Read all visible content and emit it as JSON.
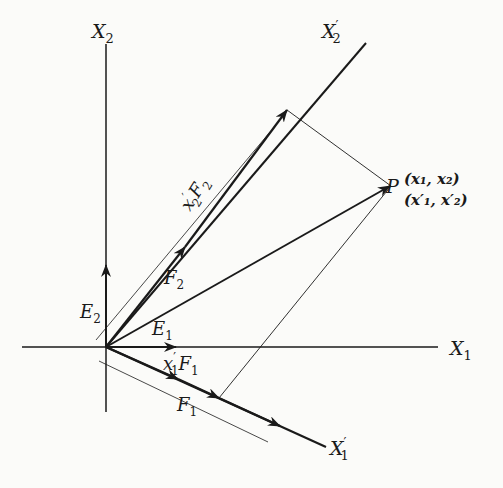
{
  "diagram": {
    "type": "oblique coordinate system vector decomposition",
    "axes": {
      "x1": {
        "label": "X",
        "sub": "1"
      },
      "x2": {
        "label": "X",
        "sub": "2"
      },
      "x1_prime": {
        "label": "X",
        "sub": "1",
        "prime": "′"
      },
      "x2_prime": {
        "label": "X",
        "sub": "2",
        "prime": "′"
      }
    },
    "vectors": {
      "e1": {
        "label": "E",
        "sub": "1"
      },
      "e2": {
        "label": "E",
        "sub": "2"
      },
      "f1": {
        "label": "F",
        "sub": "1"
      },
      "f2": {
        "label": "F",
        "sub": "2"
      },
      "x1f1": {
        "label": "x",
        "sub": "1",
        "prime": "′",
        "tail": "F",
        "tail_sub": "1"
      },
      "x2f2": {
        "label": "x",
        "sub": "2",
        "prime": "′",
        "tail": "F",
        "tail_sub": "2"
      }
    },
    "point": {
      "label": "P",
      "coords": "(x₁, x₂)",
      "coords_prime": "(x′₁, x′₂)"
    },
    "colors": {
      "ink": "#1a1a1a",
      "background": "#fbfbf9"
    }
  }
}
